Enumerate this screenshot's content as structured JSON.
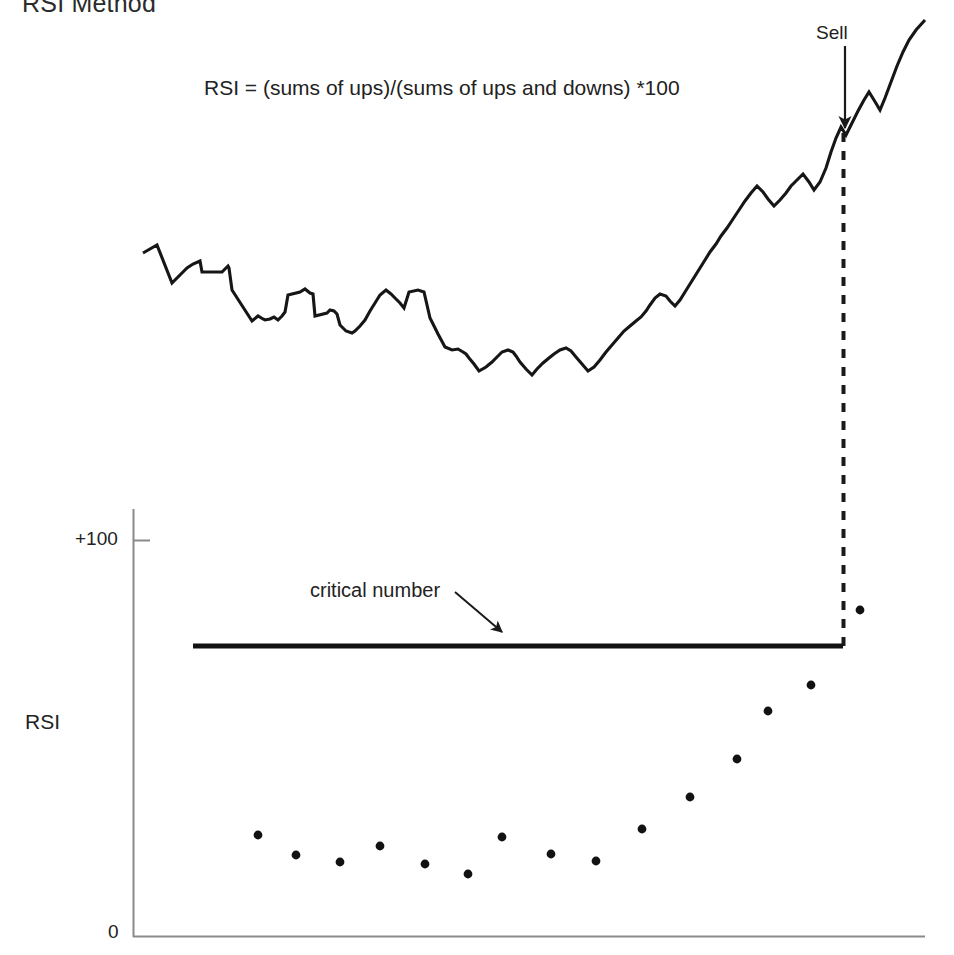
{
  "figure": {
    "title": "RSI Method",
    "formula": "RSI = (sums of ups)/(sums of ups and downs) *100",
    "width": 954,
    "height": 955,
    "background": "#ffffff",
    "ink_color": "#1a1a1a"
  },
  "annotations": {
    "sell_label": "Sell",
    "critical_label": "critical number"
  },
  "axis": {
    "y_label": "RSI",
    "y_top_tick": "+100",
    "y_bottom_tick": "0"
  },
  "chart_data": [
    {
      "type": "line",
      "name": "price-series",
      "title": "RSI Method",
      "xlabel": "",
      "ylabel": "",
      "grid": false,
      "legend": null,
      "xlim": [
        143,
        925
      ],
      "ylim": [
        20,
        400
      ],
      "annotations": [
        {
          "text": "Sell",
          "x": 845,
          "y": 30,
          "arrow_to_x": 845,
          "arrow_to_y": 130
        },
        {
          "text": "RSI = (sums of ups)/(sums of ups and downs) *100",
          "x": 204,
          "y": 86
        }
      ],
      "points": [
        [
          143,
          253
        ],
        [
          157,
          245
        ],
        [
          172,
          283
        ],
        [
          187,
          268
        ],
        [
          193,
          264
        ],
        [
          200,
          261
        ],
        [
          202,
          272
        ],
        [
          222,
          272
        ],
        [
          228,
          266
        ],
        [
          229,
          268
        ],
        [
          232,
          290
        ],
        [
          252,
          321
        ],
        [
          258,
          316
        ],
        [
          263,
          319
        ],
        [
          265,
          320
        ],
        [
          270,
          319
        ],
        [
          274,
          317
        ],
        [
          278,
          320
        ],
        [
          282,
          316
        ],
        [
          285,
          312
        ],
        [
          288,
          295
        ],
        [
          300,
          292
        ],
        [
          305,
          289
        ],
        [
          310,
          293
        ],
        [
          313,
          294
        ],
        [
          315,
          316
        ],
        [
          327,
          313
        ],
        [
          330,
          310
        ],
        [
          334,
          311
        ],
        [
          337,
          314
        ],
        [
          340,
          325
        ],
        [
          346,
          331
        ],
        [
          352,
          333
        ],
        [
          355,
          331
        ],
        [
          360,
          326
        ],
        [
          365,
          320
        ],
        [
          370,
          311
        ],
        [
          375,
          303
        ],
        [
          380,
          295
        ],
        [
          386,
          290
        ],
        [
          391,
          294
        ],
        [
          396,
          299
        ],
        [
          400,
          303
        ],
        [
          404,
          308
        ],
        [
          409,
          292
        ],
        [
          418,
          290
        ],
        [
          424,
          292
        ],
        [
          430,
          318
        ],
        [
          438,
          334
        ],
        [
          445,
          347
        ],
        [
          452,
          350
        ],
        [
          458,
          349
        ],
        [
          463,
          352
        ],
        [
          466,
          354
        ],
        [
          469,
          358
        ],
        [
          474,
          364
        ],
        [
          479,
          371
        ],
        [
          486,
          367
        ],
        [
          492,
          362
        ],
        [
          497,
          357
        ],
        [
          502,
          352
        ],
        [
          508,
          350
        ],
        [
          513,
          352
        ],
        [
          516,
          356
        ],
        [
          520,
          362
        ],
        [
          526,
          369
        ],
        [
          532,
          375
        ],
        [
          537,
          369
        ],
        [
          543,
          363
        ],
        [
          549,
          358
        ],
        [
          554,
          354
        ],
        [
          560,
          350
        ],
        [
          566,
          348
        ],
        [
          571,
          351
        ],
        [
          576,
          357
        ],
        [
          582,
          364
        ],
        [
          588,
          371
        ],
        [
          594,
          367
        ],
        [
          600,
          360
        ],
        [
          606,
          352
        ],
        [
          612,
          345
        ],
        [
          618,
          338
        ],
        [
          624,
          331
        ],
        [
          630,
          326
        ],
        [
          636,
          321
        ],
        [
          641,
          317
        ],
        [
          646,
          311
        ],
        [
          650,
          305
        ],
        [
          655,
          298
        ],
        [
          660,
          294
        ],
        [
          666,
          296
        ],
        [
          670,
          301
        ],
        [
          675,
          306
        ],
        [
          680,
          300
        ],
        [
          685,
          292
        ],
        [
          690,
          284
        ],
        [
          695,
          276
        ],
        [
          700,
          268
        ],
        [
          705,
          260
        ],
        [
          710,
          252
        ],
        [
          716,
          244
        ],
        [
          721,
          236
        ],
        [
          727,
          228
        ],
        [
          733,
          219
        ],
        [
          739,
          210
        ],
        [
          745,
          201
        ],
        [
          751,
          193
        ],
        [
          757,
          186
        ],
        [
          763,
          192
        ],
        [
          768,
          199
        ],
        [
          774,
          206
        ],
        [
          780,
          200
        ],
        [
          786,
          193
        ],
        [
          791,
          186
        ],
        [
          797,
          180
        ],
        [
          803,
          174
        ],
        [
          809,
          182
        ],
        [
          814,
          190
        ],
        [
          820,
          182
        ],
        [
          826,
          168
        ],
        [
          831,
          152
        ],
        [
          836,
          138
        ],
        [
          841,
          127
        ],
        [
          846,
          135
        ],
        [
          852,
          123
        ],
        [
          858,
          111
        ],
        [
          864,
          100
        ],
        [
          869,
          92
        ],
        [
          874,
          100
        ],
        [
          880,
          110
        ],
        [
          885,
          98
        ],
        [
          891,
          82
        ],
        [
          897,
          66
        ],
        [
          903,
          52
        ],
        [
          909,
          40
        ],
        [
          916,
          30
        ],
        [
          925,
          20
        ]
      ]
    },
    {
      "type": "scatter",
      "name": "rsi-indicator",
      "title": "",
      "xlabel": "",
      "ylabel": "RSI",
      "grid": false,
      "legend": null,
      "xlim": [
        133,
        925
      ],
      "ylim": [
        0,
        100
      ],
      "y_ticks": [
        {
          "value": 100,
          "label": "+100",
          "py": 540
        },
        {
          "value": 0,
          "label": "0",
          "py": 937
        }
      ],
      "critical_line": {
        "label": "critical number",
        "y_value": 73,
        "py": 646,
        "x_start": 193,
        "x_end": 843
      },
      "annotations": [
        {
          "text": "critical number",
          "x": 310,
          "y": 589,
          "arrow_to_x": 503,
          "arrow_to_y": 634
        }
      ],
      "points": [
        [
          258,
          835
        ],
        [
          296,
          855
        ],
        [
          340,
          862
        ],
        [
          380,
          846
        ],
        [
          425,
          864
        ],
        [
          468,
          874
        ],
        [
          502,
          837
        ],
        [
          551,
          854
        ],
        [
          596,
          861
        ],
        [
          642,
          829
        ],
        [
          690,
          797
        ],
        [
          737,
          759
        ],
        [
          768,
          711
        ],
        [
          811,
          685
        ],
        [
          860,
          610
        ]
      ],
      "values": [
        24,
        20,
        19,
        22,
        18,
        16,
        24,
        20,
        19,
        26,
        32,
        40,
        51,
        57,
        73
      ]
    }
  ]
}
